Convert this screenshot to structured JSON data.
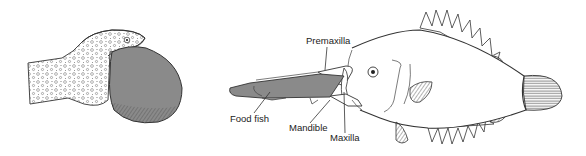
{
  "figure": {
    "left_panel": {
      "subject": "fish-with-oversized-prey-in-stomach"
    },
    "right_panel": {
      "subject": "fish-with-protrusible-jaws-capturing-prey",
      "labels": {
        "premaxilla": "Premaxilla",
        "food_fish": "Food fish",
        "mandible": "Mandible",
        "maxilla": "Maxilla"
      }
    },
    "colors": {
      "prey_fill": "#8a8a8a",
      "prey_dark": "#6f6f6f",
      "line": "#333333",
      "background": "#ffffff"
    }
  }
}
